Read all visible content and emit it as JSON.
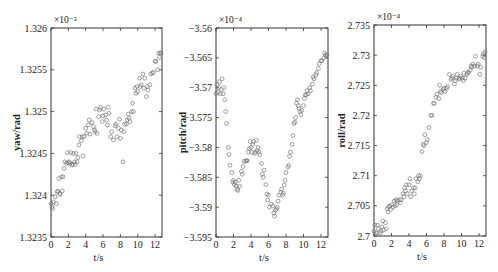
{
  "chart_data": [
    {
      "type": "scatter",
      "title": "",
      "xlabel": "t/s",
      "ylabel": "yaw/rad",
      "exponent_label": "×10⁻³",
      "xlim": [
        0,
        12.8
      ],
      "ylim": [
        1.3235,
        1.326
      ],
      "xticks": [
        0,
        2,
        4,
        6,
        8,
        10,
        12
      ],
      "xtick_labels": [
        "0",
        "2",
        "4",
        "6",
        "8",
        "10",
        "12"
      ],
      "yticks": [
        1.3235,
        1.324,
        1.3245,
        1.325,
        1.3255,
        1.326
      ],
      "ytick_labels": [
        "1.3235",
        "1.324",
        "1.3245",
        "1.325",
        "1.3255",
        "1.326"
      ],
      "grid": false,
      "marker": "open-circle",
      "x": [
        0.0,
        0.1,
        0.2,
        0.3,
        0.5,
        0.6,
        0.7,
        0.8,
        0.9,
        1.0,
        1.1,
        1.2,
        1.3,
        1.4,
        1.5,
        1.6,
        1.8,
        1.9,
        2.0,
        2.1,
        2.2,
        2.3,
        2.4,
        2.5,
        2.6,
        2.7,
        2.8,
        2.9,
        3.0,
        3.1,
        3.2,
        3.3,
        3.5,
        3.6,
        3.7,
        3.8,
        4.0,
        4.1,
        4.3,
        4.4,
        4.5,
        4.7,
        4.9,
        5.0,
        5.1,
        5.2,
        5.3,
        5.5,
        5.6,
        5.7,
        5.9,
        6.0,
        6.1,
        6.3,
        6.4,
        6.5,
        6.6,
        6.7,
        6.9,
        7.0,
        7.2,
        7.4,
        7.5,
        7.6,
        7.8,
        7.9,
        8.0,
        8.1,
        8.3,
        8.4,
        8.5,
        8.7,
        8.8,
        8.9,
        9.0,
        9.1,
        9.3,
        9.4,
        9.5,
        9.7,
        9.8,
        9.9,
        10.0,
        10.2,
        10.3,
        10.4,
        10.6,
        10.7,
        10.8,
        11.0,
        11.1,
        11.2,
        11.4,
        11.5,
        11.7,
        11.8,
        12.0,
        12.1,
        12.3,
        12.4,
        12.5,
        12.6,
        12.7
      ],
      "values": [
        1.3239,
        1.32386,
        1.32384,
        1.32392,
        1.32398,
        1.3239,
        1.32404,
        1.32405,
        1.3242,
        1.32402,
        1.32401,
        1.32422,
        1.32405,
        1.32422,
        1.32432,
        1.3244,
        1.32438,
        1.32451,
        1.32439,
        1.3244,
        1.32438,
        1.32451,
        1.32436,
        1.32437,
        1.3245,
        1.3244,
        1.32437,
        1.3245,
        1.3244,
        1.32445,
        1.3246,
        1.3247,
        1.32465,
        1.3247,
        1.32447,
        1.3247,
        1.3248,
        1.32474,
        1.32484,
        1.3249,
        1.32473,
        1.32487,
        1.32482,
        1.32478,
        1.32476,
        1.32503,
        1.32474,
        1.32494,
        1.32502,
        1.32505,
        1.32488,
        1.32495,
        1.32503,
        1.32496,
        1.3249,
        1.32484,
        1.32505,
        1.32498,
        1.3247,
        1.32476,
        1.32466,
        1.32483,
        1.32485,
        1.3247,
        1.3248,
        1.32491,
        1.32468,
        1.32478,
        1.3244,
        1.32476,
        1.32485,
        1.32485,
        1.3249,
        1.32497,
        1.32492,
        1.32488,
        1.325,
        1.3251,
        1.325,
        1.32528,
        1.32522,
        1.3253,
        1.32524,
        1.3254,
        1.3253,
        1.32532,
        1.32545,
        1.32528,
        1.3254,
        1.32518,
        1.3253,
        1.32526,
        1.32532,
        1.32545,
        1.32546,
        1.32547,
        1.3256,
        1.3256,
        1.3255,
        1.3257,
        1.32565,
        1.3257,
        1.3257
      ]
    },
    {
      "type": "scatter",
      "title": "",
      "xlabel": "t/s",
      "ylabel": "pitch/rad",
      "exponent_label": "×10⁻⁴",
      "xlim": [
        0,
        12.8
      ],
      "ylim": [
        -3.595,
        -3.56
      ],
      "xticks": [
        0,
        2,
        4,
        6,
        8,
        10,
        12
      ],
      "xtick_labels": [
        "0",
        "2",
        "4",
        "6",
        "8",
        "10",
        "12"
      ],
      "yticks": [
        -3.595,
        -3.59,
        -3.585,
        -3.58,
        -3.575,
        -3.57,
        -3.565,
        -3.56
      ],
      "ytick_labels": [
        "-3.595",
        "-3.59",
        "-3.585",
        "-3.58",
        "-3.575",
        "-3.57",
        "-3.565",
        "-3.56"
      ],
      "grid": false,
      "marker": "open-circle",
      "x": [
        0.0,
        0.1,
        0.2,
        0.3,
        0.4,
        0.5,
        0.6,
        0.7,
        0.8,
        0.9,
        1.0,
        1.1,
        1.2,
        1.4,
        1.5,
        1.6,
        1.8,
        1.9,
        2.0,
        2.1,
        2.2,
        2.3,
        2.4,
        2.5,
        2.6,
        2.7,
        2.9,
        3.0,
        3.1,
        3.2,
        3.4,
        3.5,
        3.6,
        3.7,
        3.8,
        3.9,
        4.0,
        4.1,
        4.2,
        4.3,
        4.4,
        4.5,
        4.6,
        4.7,
        4.8,
        4.9,
        5.0,
        5.2,
        5.3,
        5.4,
        5.5,
        5.7,
        5.8,
        5.9,
        6.0,
        6.1,
        6.3,
        6.5,
        6.6,
        6.7,
        6.8,
        6.9,
        7.0,
        7.1,
        7.2,
        7.4,
        7.5,
        7.6,
        7.7,
        7.8,
        7.9,
        8.0,
        8.2,
        8.3,
        8.4,
        8.5,
        8.7,
        8.8,
        8.9,
        9.0,
        9.1,
        9.2,
        9.3,
        9.4,
        9.5,
        9.6,
        9.7,
        9.8,
        10.0,
        10.1,
        10.2,
        10.3,
        10.4,
        10.5,
        10.7,
        10.8,
        11.0,
        11.1,
        11.2,
        11.4,
        11.5,
        11.7,
        11.8,
        12.0,
        12.1,
        12.3,
        12.4,
        12.5,
        12.6,
        12.7
      ],
      "values": [
        -3.571,
        -3.5695,
        -3.5708,
        -3.57,
        -3.569,
        -3.571,
        -3.5703,
        -3.5685,
        -3.571,
        -3.57,
        -3.572,
        -3.574,
        -3.576,
        -3.58,
        -3.5812,
        -3.583,
        -3.5842,
        -3.5858,
        -3.5855,
        -3.5862,
        -3.5858,
        -3.5865,
        -3.587,
        -3.5872,
        -3.5855,
        -3.5865,
        -3.584,
        -3.5845,
        -3.5832,
        -3.5823,
        -3.5823,
        -3.5822,
        -3.5822,
        -3.5808,
        -3.5802,
        -3.579,
        -3.58,
        -3.5808,
        -3.5795,
        -3.579,
        -3.581,
        -3.5808,
        -3.5788,
        -3.5805,
        -3.58,
        -3.5808,
        -3.5812,
        -3.5827,
        -3.5845,
        -3.585,
        -3.5838,
        -3.5862,
        -3.5878,
        -3.5888,
        -3.588,
        -3.59,
        -3.5895,
        -3.5898,
        -3.591,
        -3.5915,
        -3.5905,
        -3.5903,
        -3.59,
        -3.589,
        -3.588,
        -3.5875,
        -3.587,
        -3.588,
        -3.5877,
        -3.5863,
        -3.5855,
        -3.5842,
        -3.5833,
        -3.583,
        -3.5815,
        -3.5808,
        -3.5795,
        -3.578,
        -3.576,
        -3.5758,
        -3.575,
        -3.5726,
        -3.572,
        -3.573,
        -3.5735,
        -3.574,
        -3.5745,
        -3.5738,
        -3.573,
        -3.5718,
        -3.5712,
        -3.5712,
        -3.5705,
        -3.571,
        -3.57,
        -3.5705,
        -3.5694,
        -3.5682,
        -3.5685,
        -3.5678,
        -3.5675,
        -3.5668,
        -3.566,
        -3.5655,
        -3.5655,
        -3.565,
        -3.5642,
        -3.5645,
        -3.5648,
        -3.5645
      ]
    },
    {
      "type": "scatter",
      "title": "",
      "xlabel": "t/s",
      "ylabel": "roll/rad",
      "exponent_label": "×10⁻⁴",
      "xlim": [
        0,
        12.8
      ],
      "ylim": [
        2.7,
        2.735
      ],
      "xticks": [
        0,
        2,
        4,
        6,
        8,
        10,
        12
      ],
      "xtick_labels": [
        "0",
        "2",
        "4",
        "6",
        "8",
        "10",
        "12"
      ],
      "yticks": [
        2.7,
        2.705,
        2.71,
        2.715,
        2.72,
        2.725,
        2.73,
        2.735
      ],
      "ytick_labels": [
        "2.7",
        "2.705",
        "2.71",
        "2.715",
        "2.72",
        "2.725",
        "2.73",
        "2.735"
      ],
      "grid": false,
      "marker": "open-circle",
      "x": [
        0.0,
        0.1,
        0.2,
        0.3,
        0.4,
        0.5,
        0.7,
        0.8,
        0.9,
        1.0,
        1.1,
        1.3,
        1.4,
        1.5,
        1.6,
        1.7,
        1.8,
        1.9,
        2.0,
        2.2,
        2.3,
        2.4,
        2.5,
        2.6,
        2.7,
        2.9,
        3.0,
        3.1,
        3.3,
        3.4,
        3.5,
        3.6,
        3.7,
        3.8,
        4.0,
        4.1,
        4.2,
        4.3,
        4.5,
        4.6,
        4.7,
        4.8,
        5.0,
        5.1,
        5.2,
        5.3,
        5.5,
        5.6,
        5.7,
        5.8,
        6.0,
        6.1,
        6.3,
        6.5,
        6.6,
        6.8,
        6.9,
        7.1,
        7.2,
        7.4,
        7.5,
        7.6,
        7.7,
        7.9,
        8.0,
        8.1,
        8.3,
        8.4,
        8.6,
        8.8,
        8.9,
        9.0,
        9.2,
        9.3,
        9.4,
        9.5,
        9.7,
        9.8,
        9.9,
        10.1,
        10.2,
        10.3,
        10.4,
        10.6,
        10.7,
        10.8,
        11.0,
        11.1,
        11.2,
        11.3,
        11.5,
        11.6,
        11.8,
        11.9,
        12.1,
        12.2,
        12.4,
        12.5,
        12.6,
        12.7
      ],
      "values": [
        2.7008,
        2.7018,
        2.7002,
        2.7005,
        2.7018,
        2.7012,
        2.7005,
        2.7008,
        2.7015,
        2.7025,
        2.701,
        2.7022,
        2.7012,
        2.7045,
        2.704,
        2.7048,
        2.705,
        2.7044,
        2.7052,
        2.7048,
        2.7058,
        2.705,
        2.706,
        2.7052,
        2.7058,
        2.706,
        2.7055,
        2.706,
        2.707,
        2.7065,
        2.708,
        2.7075,
        2.7085,
        2.707,
        2.7085,
        2.7095,
        2.7065,
        2.7075,
        2.708,
        2.707,
        2.708,
        2.7095,
        2.709,
        2.71,
        2.7095,
        2.71,
        2.714,
        2.7152,
        2.715,
        2.7168,
        2.7155,
        2.716,
        2.718,
        2.72,
        2.72,
        2.722,
        2.722,
        2.723,
        2.7235,
        2.7228,
        2.725,
        2.724,
        2.7238,
        2.7243,
        2.7245,
        2.724,
        2.7245,
        2.7248,
        2.7268,
        2.726,
        2.7262,
        2.7265,
        2.7252,
        2.7258,
        2.7262,
        2.7268,
        2.726,
        2.7262,
        2.7265,
        2.7262,
        2.7258,
        2.727,
        2.7262,
        2.7268,
        2.727,
        2.7272,
        2.7275,
        2.7282,
        2.728,
        2.7285,
        2.7282,
        2.7298,
        2.7282,
        2.7285,
        2.7268,
        2.728,
        2.7298,
        2.7302,
        2.7296,
        2.7305
      ]
    }
  ]
}
